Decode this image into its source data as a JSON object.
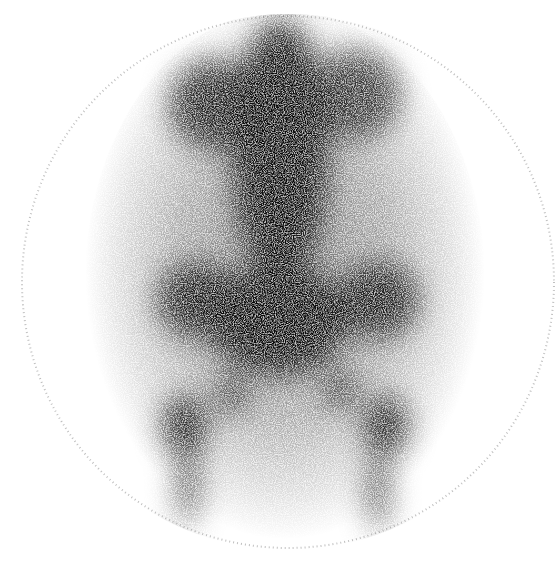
{
  "image": {
    "subject": "scintigraphy-bone-scan-pelvis",
    "background_color": "#ffffff",
    "tracer_color": "#000000",
    "field_of_view": {
      "cx": 288,
      "cy": 282,
      "rx": 268,
      "ry": 268
    },
    "regions": [
      {
        "name": "lumbar-spine",
        "cx": 280,
        "cy": 150,
        "rx": 48,
        "ry": 130,
        "opacity": 0.95
      },
      {
        "name": "upper-abdomen-left",
        "cx": 215,
        "cy": 105,
        "rx": 45,
        "ry": 45,
        "opacity": 0.85
      },
      {
        "name": "upper-abdomen-right",
        "cx": 355,
        "cy": 95,
        "rx": 45,
        "ry": 45,
        "opacity": 0.75
      },
      {
        "name": "sacrum",
        "cx": 278,
        "cy": 320,
        "rx": 70,
        "ry": 55,
        "opacity": 0.95
      },
      {
        "name": "left-iliac-wing",
        "cx": 198,
        "cy": 300,
        "rx": 40,
        "ry": 38,
        "opacity": 0.85
      },
      {
        "name": "right-iliac-wing",
        "cx": 378,
        "cy": 300,
        "rx": 40,
        "ry": 38,
        "opacity": 0.85
      },
      {
        "name": "left-hip",
        "cx": 185,
        "cy": 425,
        "rx": 22,
        "ry": 30,
        "opacity": 0.9
      },
      {
        "name": "right-hip",
        "cx": 385,
        "cy": 425,
        "rx": 22,
        "ry": 30,
        "opacity": 0.9
      },
      {
        "name": "left-ischium",
        "cx": 232,
        "cy": 395,
        "rx": 14,
        "ry": 18,
        "opacity": 0.85
      },
      {
        "name": "right-ischium",
        "cx": 340,
        "cy": 390,
        "rx": 14,
        "ry": 18,
        "opacity": 0.85
      },
      {
        "name": "left-femur",
        "cx": 188,
        "cy": 485,
        "rx": 12,
        "ry": 40,
        "opacity": 0.7
      },
      {
        "name": "right-femur",
        "cx": 378,
        "cy": 490,
        "rx": 12,
        "ry": 40,
        "opacity": 0.7
      }
    ]
  }
}
